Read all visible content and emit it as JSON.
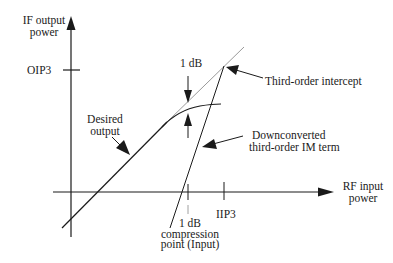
{
  "diagram": {
    "type": "IP3 / 1 dB compression diagram",
    "axes": {
      "y_label_line1": "IF output",
      "y_label_line2": "power",
      "x_label_line1": "RF input",
      "x_label_line2": "power"
    },
    "ticks": {
      "oip3": "OIP3",
      "iip3": "IIP3",
      "compression_line1": "1 dB",
      "compression_line2": "compression",
      "compression_line3": "point (Input)"
    },
    "annotations": {
      "one_db": "1 dB",
      "third_order_intercept": "Third-order intercept",
      "desired_output_line1": "Desired",
      "desired_output_line2": "output",
      "im_term_line1": "Downconverted",
      "im_term_line2": "third-order IM term"
    },
    "colors": {
      "line": "#1a1a1a",
      "extrapolation": "#9a9a9a"
    }
  }
}
